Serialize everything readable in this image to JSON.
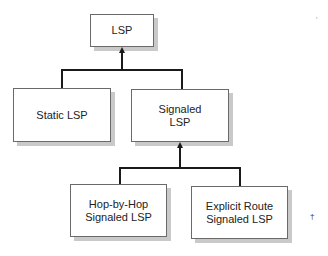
{
  "diagram": {
    "type": "tree",
    "nodes": {
      "lsp": "LSP",
      "static": "Static LSP",
      "signaled": "Signaled\nLSP",
      "hop_by_hop": "Hop-by-Hop\nSignaled LSP",
      "explicit_route": "Explicit Route\nSignaled LSP"
    },
    "edges": [
      {
        "from": "static",
        "to": "lsp"
      },
      {
        "from": "signaled",
        "to": "lsp"
      },
      {
        "from": "hop_by_hop",
        "to": "signaled"
      },
      {
        "from": "explicit_route",
        "to": "signaled"
      }
    ],
    "colors": {
      "box_border": "#6a6a6a",
      "shadow": "#c9c9c9",
      "line": "#1a1a1a"
    }
  }
}
